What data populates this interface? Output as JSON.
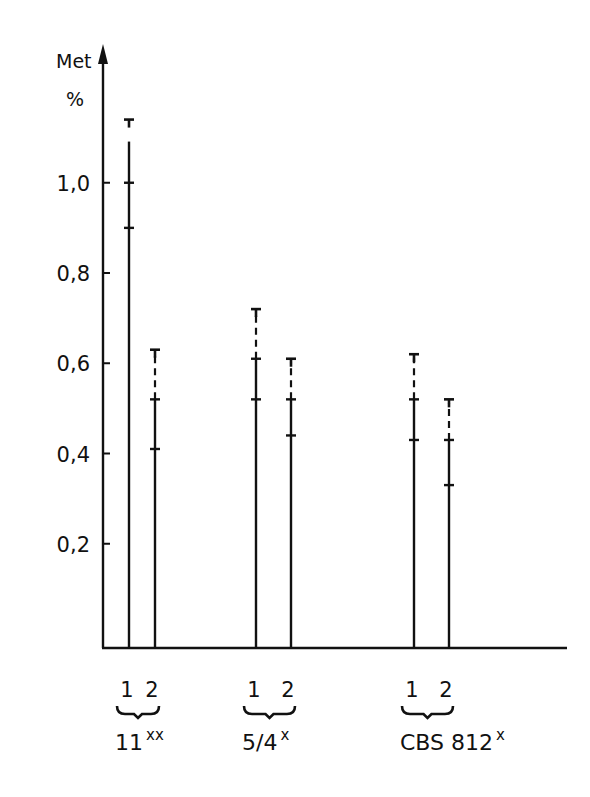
{
  "chart_data": {
    "type": "bar",
    "subtype": "range-bars-with-error-caps",
    "title": "",
    "ylabel": "Met\n%",
    "ylabel_lines": [
      "Met",
      "%"
    ],
    "xlabel": "",
    "ylim": [
      0,
      1.2
    ],
    "yticks": [
      0.2,
      0.4,
      0.6,
      0.8,
      1.0
    ],
    "ytick_labels": [
      "0,2",
      "0,4",
      "0,6",
      "0,8",
      "1,0"
    ],
    "grid": false,
    "legend": null,
    "groups": [
      {
        "name": "11",
        "superscript": "xx",
        "bars": [
          {
            "label": "1",
            "upper_cap": 1.14,
            "mean": 1.0,
            "lower": 0.9
          },
          {
            "label": "2",
            "upper_cap": 0.63,
            "mean": 0.52,
            "lower": 0.41
          }
        ]
      },
      {
        "name": "5/4",
        "superscript": "x",
        "bars": [
          {
            "label": "1",
            "upper_cap": 0.72,
            "mean": 0.61,
            "lower": 0.52
          },
          {
            "label": "2",
            "upper_cap": 0.61,
            "mean": 0.52,
            "lower": 0.44
          }
        ]
      },
      {
        "name": "CBS 812",
        "superscript": "x",
        "bars": [
          {
            "label": "1",
            "upper_cap": 0.62,
            "mean": 0.52,
            "lower": 0.43
          },
          {
            "label": "2",
            "upper_cap": 0.52,
            "mean": 0.43,
            "lower": 0.33
          }
        ]
      }
    ]
  },
  "axis": {
    "ylabel_top": "Met",
    "ylabel_bottom": "%"
  },
  "ticks": [
    {
      "label": "1,0",
      "value": 1.0
    },
    {
      "label": "0,8",
      "value": 0.8
    },
    {
      "label": "0,6",
      "value": 0.6
    },
    {
      "label": "0,4",
      "value": 0.4
    },
    {
      "label": "0,2",
      "value": 0.2
    }
  ],
  "groups": [
    {
      "name": "11",
      "sup": "xx",
      "sub1": "1",
      "sub2": "2"
    },
    {
      "name": "5/4",
      "sup": "x",
      "sub1": "1",
      "sub2": "2"
    },
    {
      "name": "CBS 812",
      "sup": "x",
      "sub1": "1",
      "sub2": "2"
    }
  ]
}
